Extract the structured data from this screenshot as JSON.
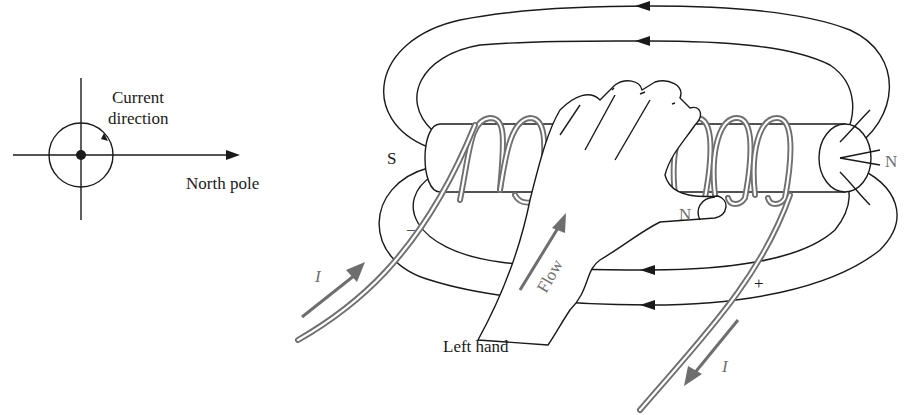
{
  "left_figure": {
    "current_label_line1": "Current",
    "current_label_line2": "direction",
    "axis_label": "North pole"
  },
  "solenoid": {
    "south_pole_label": "S",
    "north_pole_label": "N",
    "thumb_label": "N",
    "negative_terminal": "−",
    "positive_terminal": "+",
    "current_in_label": "I",
    "current_out_label": "I",
    "flow_label": "Flow",
    "hand_label": "Left hand",
    "coil_turns": 5,
    "field_line_arrows": 4
  },
  "colors": {
    "line": "#1a1a1a",
    "wire": "#707070",
    "label_gray": "#6e6e6e",
    "background": "#ffffff"
  }
}
